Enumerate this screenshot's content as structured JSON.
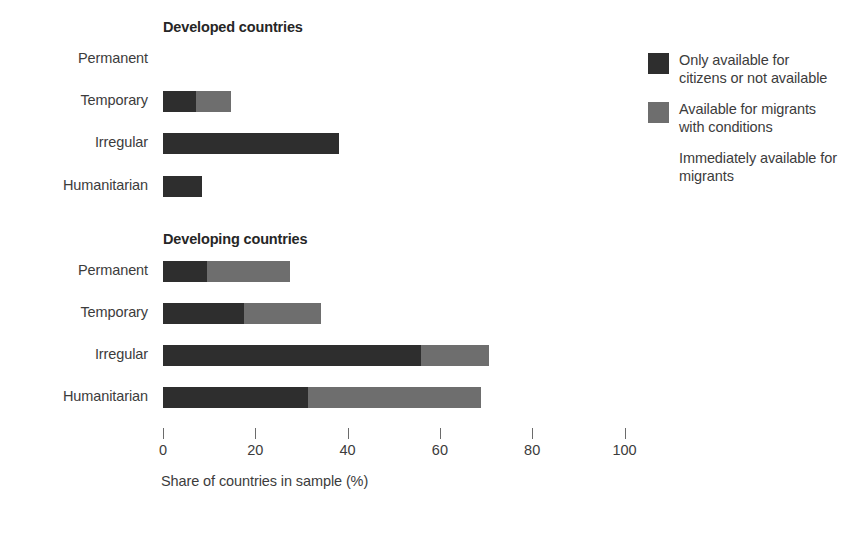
{
  "chart_data": {
    "type": "bar",
    "orientation": "horizontal",
    "stacked": true,
    "title": "",
    "xlabel": "Share of countries in sample (%)",
    "ylabel": "",
    "xlim": [
      0,
      100
    ],
    "xticks": [
      0,
      20,
      40,
      60,
      80,
      100
    ],
    "xticklabels": [
      "0",
      "20",
      "40",
      "60",
      "80",
      "100"
    ],
    "grid": false,
    "legend_position": "right",
    "categories": [
      "Permanent",
      "Temporary",
      "Irregular",
      "Humanitarian"
    ],
    "series": [
      {
        "name": "Only available for citizens or not available",
        "color": "#2e2e2e"
      },
      {
        "name": "Available for migrants with conditions",
        "color": "#6e6e6e"
      },
      {
        "name": "Immediately available for migrants",
        "color": "#ffffff"
      }
    ],
    "panels": [
      {
        "title": "Developed countries",
        "categories": [
          "Permanent",
          "Temporary",
          "Irregular",
          "Humanitarian"
        ],
        "values": [
          [
            0.0,
            0.0,
            0.0
          ],
          [
            7.2,
            7.6,
            0.0
          ],
          [
            38.2,
            0.0,
            0.0
          ],
          [
            8.5,
            0.0,
            0.0
          ]
        ]
      },
      {
        "title": "Developing countries",
        "categories": [
          "Permanent",
          "Temporary",
          "Irregular",
          "Humanitarian"
        ],
        "values": [
          [
            9.5,
            18.0,
            0.0
          ],
          [
            17.6,
            16.7,
            0.0
          ],
          [
            56.0,
            14.7,
            0.0
          ],
          [
            31.5,
            37.5,
            0.0
          ]
        ]
      }
    ]
  },
  "panels": {
    "developed": {
      "title": "Developed countries",
      "rows": [
        {
          "label": "Permanent",
          "dark": 0.0,
          "grey": 0.0,
          "light": 0.0
        },
        {
          "label": "Temporary",
          "dark": 7.2,
          "grey": 7.6,
          "light": 0.0
        },
        {
          "label": "Irregular",
          "dark": 38.2,
          "grey": 0.0,
          "light": 0.0
        },
        {
          "label": "Humanitarian",
          "dark": 8.5,
          "grey": 0.0,
          "light": 0.0
        }
      ]
    },
    "developing": {
      "title": "Developing countries",
      "rows": [
        {
          "label": "Permanent",
          "dark": 9.5,
          "grey": 18.0,
          "light": 0.0
        },
        {
          "label": "Temporary",
          "dark": 17.6,
          "grey": 16.7,
          "light": 0.0
        },
        {
          "label": "Irregular",
          "dark": 56.0,
          "grey": 14.7,
          "light": 0.0
        },
        {
          "label": "Humanitarian",
          "dark": 31.5,
          "grey": 37.5,
          "light": 0.0
        }
      ]
    }
  },
  "axis": {
    "title": "Share of countries in sample (%)",
    "ticks": [
      "0",
      "20",
      "40",
      "60",
      "80",
      "100"
    ]
  },
  "legend": {
    "items": [
      {
        "label": "Only available for citizens or not available",
        "color": "#2e2e2e"
      },
      {
        "label": "Available for migrants with conditions",
        "color": "#6e6e6e"
      },
      {
        "label": "Immediately available for migrants",
        "color": "#ffffff"
      }
    ]
  }
}
